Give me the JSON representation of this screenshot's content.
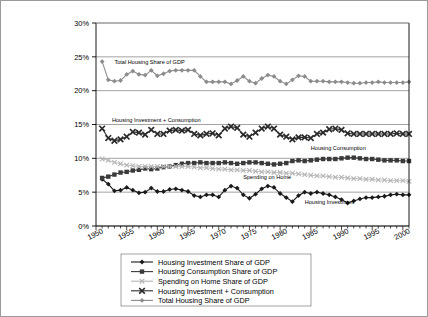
{
  "chart_data": {
    "type": "line",
    "title": "",
    "xlabel": "",
    "ylabel": "",
    "xlim": [
      1950,
      2001
    ],
    "ylim": [
      0,
      30
    ],
    "ytick_labels": [
      "0%",
      "5%",
      "10%",
      "15%",
      "20%",
      "25%",
      "30%"
    ],
    "ytick_values": [
      0,
      5,
      10,
      15,
      20,
      25,
      30
    ],
    "xtick_labels": [
      "1950",
      "1955",
      "1960",
      "1965",
      "1970",
      "1975",
      "1980",
      "1985",
      "1990",
      "1995",
      "2000"
    ],
    "xtick_values": [
      1950,
      1955,
      1960,
      1965,
      1970,
      1975,
      1980,
      1985,
      1990,
      1995,
      2000
    ],
    "grid": "horizontal",
    "legend_position": "below",
    "x": [
      1951,
      1952,
      1953,
      1954,
      1955,
      1956,
      1957,
      1958,
      1959,
      1960,
      1961,
      1962,
      1963,
      1964,
      1965,
      1966,
      1967,
      1968,
      1969,
      1970,
      1971,
      1972,
      1973,
      1974,
      1975,
      1976,
      1977,
      1978,
      1979,
      1980,
      1981,
      1982,
      1983,
      1984,
      1985,
      1986,
      1987,
      1988,
      1989,
      1990,
      1991,
      1992,
      1993,
      1994,
      1995,
      1996,
      1997,
      1998,
      1999,
      2000,
      2001
    ],
    "series": [
      {
        "name": "Housing Investment Share of GDP",
        "marker": "diamond",
        "color": "#1a1a1a",
        "values": [
          6.9,
          6.2,
          5.2,
          5.3,
          5.7,
          5.3,
          4.9,
          5.0,
          5.6,
          5.1,
          5.1,
          5.4,
          5.5,
          5.3,
          5.1,
          4.5,
          4.3,
          4.6,
          4.6,
          4.3,
          5.3,
          5.9,
          5.6,
          4.6,
          4.1,
          4.7,
          5.5,
          5.9,
          5.7,
          4.8,
          4.2,
          3.6,
          4.5,
          5.0,
          4.8,
          5.0,
          4.8,
          4.6,
          4.3,
          3.9,
          3.4,
          3.7,
          4.0,
          4.2,
          4.2,
          4.3,
          4.4,
          4.6,
          4.7,
          4.6,
          4.6
        ]
      },
      {
        "name": "Housing Consumption Share of GDP",
        "marker": "square",
        "color": "#3a3a3a",
        "values": [
          7.1,
          7.3,
          7.6,
          7.9,
          8.0,
          8.2,
          8.3,
          8.5,
          8.4,
          8.5,
          8.7,
          8.8,
          9.0,
          9.2,
          9.3,
          9.3,
          9.4,
          9.3,
          9.3,
          9.3,
          9.4,
          9.3,
          9.2,
          9.3,
          9.4,
          9.4,
          9.3,
          9.2,
          9.1,
          9.2,
          9.3,
          9.6,
          9.7,
          9.6,
          9.7,
          9.8,
          9.9,
          9.9,
          9.9,
          10.0,
          10.1,
          10.1,
          10.0,
          9.9,
          9.9,
          9.8,
          9.7,
          9.7,
          9.7,
          9.6,
          9.6
        ]
      },
      {
        "name": "Spending on Home Share of GDP",
        "marker": "x",
        "color": "#b5b5b5",
        "values": [
          9.9,
          9.7,
          9.4,
          9.2,
          9.0,
          8.9,
          8.8,
          8.8,
          8.8,
          8.8,
          8.8,
          8.8,
          8.8,
          8.8,
          8.8,
          8.7,
          8.6,
          8.6,
          8.5,
          8.4,
          8.4,
          8.3,
          8.3,
          8.2,
          8.2,
          8.1,
          8.0,
          8.0,
          7.9,
          7.9,
          7.8,
          7.8,
          7.7,
          7.6,
          7.5,
          7.4,
          7.4,
          7.3,
          7.2,
          7.2,
          7.1,
          7.0,
          7.0,
          6.9,
          6.9,
          6.8,
          6.8,
          6.7,
          6.7,
          6.7,
          6.6
        ]
      },
      {
        "name": "Housing Investment + Consumption",
        "marker": "x-square",
        "color": "#2b2b2b",
        "values": [
          14.4,
          13.0,
          12.6,
          12.8,
          13.2,
          13.9,
          13.8,
          13.5,
          14.2,
          13.6,
          13.6,
          14.1,
          14.2,
          14.1,
          14.2,
          13.6,
          13.4,
          13.6,
          13.7,
          13.4,
          14.4,
          14.7,
          14.5,
          13.5,
          13.2,
          13.8,
          14.4,
          14.7,
          14.4,
          13.5,
          13.2,
          12.8,
          13.1,
          13.1,
          13.0,
          13.6,
          13.8,
          14.3,
          14.4,
          14.2,
          13.7,
          13.6,
          13.6,
          13.6,
          13.6,
          13.6,
          13.6,
          13.6,
          13.7,
          13.6,
          13.6
        ]
      },
      {
        "name": "Total Housing Share of GDP",
        "marker": "diamond",
        "color": "#8c8c8c",
        "values": [
          24.3,
          21.6,
          21.4,
          21.5,
          22.4,
          22.9,
          22.4,
          22.3,
          23.0,
          22.2,
          22.5,
          22.9,
          23.0,
          23.0,
          23.0,
          23.0,
          22.1,
          21.3,
          21.3,
          21.3,
          21.3,
          21.0,
          21.5,
          22.1,
          21.4,
          21.1,
          21.8,
          22.3,
          22.1,
          21.4,
          21.0,
          21.6,
          22.2,
          22.1,
          21.4,
          21.4,
          21.4,
          21.3,
          21.3,
          21.3,
          21.2,
          21.1,
          21.1,
          21.2,
          21.2,
          21.3,
          21.2,
          21.2,
          21.2,
          21.2,
          21.3
        ]
      }
    ],
    "annotations": [
      {
        "text": "Total Housing Share of GDP",
        "x": 1953.0,
        "y": 24.0
      },
      {
        "text": "Housing Investment  +  Consumption",
        "x": 1952.6,
        "y": 15.4
      },
      {
        "text": "Housing Consumption",
        "x": 1985.0,
        "y": 11.2
      },
      {
        "text": "Spending on Home",
        "x": 1974.0,
        "y": 7.0
      },
      {
        "text": "Housing Investment",
        "x": 1984.0,
        "y": 3.3
      }
    ],
    "legend": [
      {
        "label": "Housing Investment Share of GDP",
        "marker": "diamond",
        "color": "#1a1a1a"
      },
      {
        "label": "Housing Consumption Share of GDP",
        "marker": "square",
        "color": "#3a3a3a"
      },
      {
        "label": "Spending on Home Share of GDP",
        "marker": "x",
        "color": "#b5b5b5"
      },
      {
        "label": "Housing Investment + Consumption",
        "marker": "x-square",
        "color": "#2b2b2b"
      },
      {
        "label": "Total Housing Share of GDP",
        "marker": "diamond",
        "color": "#8c8c8c"
      }
    ]
  }
}
